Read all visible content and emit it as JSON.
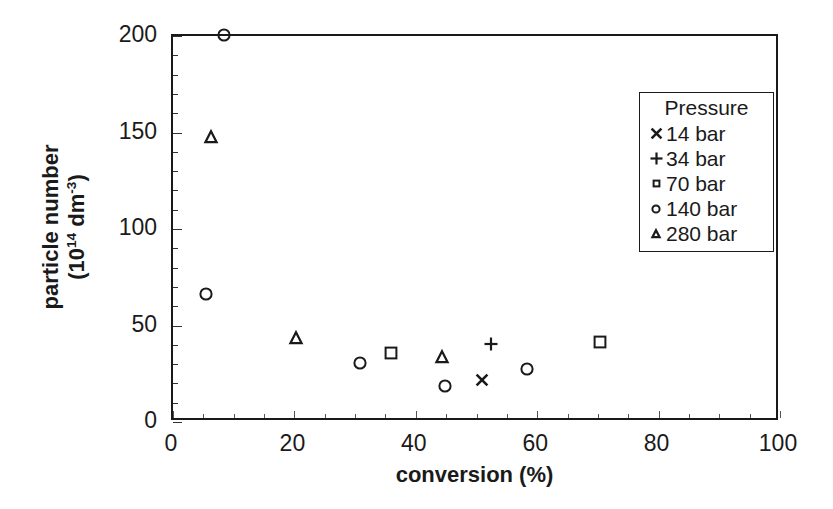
{
  "chart_data": {
    "type": "scatter",
    "title": "",
    "xlabel": "conversion (%)",
    "ylabel_line1": "particle number",
    "ylabel_line2_pre": "(10",
    "ylabel_line2_sup1": "14",
    "ylabel_line2_mid": " dm",
    "ylabel_line2_sup2": "-3",
    "ylabel_line2_post": ")",
    "xlim": [
      0,
      100
    ],
    "ylim": [
      0,
      200
    ],
    "xticks": [
      0,
      20,
      40,
      60,
      80,
      100
    ],
    "yticks": [
      0,
      50,
      100,
      150,
      200
    ],
    "x_minor_step": 5,
    "y_minor_step": 10,
    "grid": false,
    "legend_position": "upper-right",
    "legend_title": "Pressure",
    "series": [
      {
        "name": "14 bar",
        "label": "14 bar",
        "marker": "cross-x",
        "points": [
          [
            51.0,
            21
          ]
        ]
      },
      {
        "name": "34 bar",
        "label": "34 bar",
        "marker": "plus",
        "points": [
          [
            52.5,
            40
          ]
        ]
      },
      {
        "name": "70 bar",
        "label": "70 bar",
        "marker": "square",
        "points": [
          [
            36.0,
            35
          ],
          [
            70.5,
            41
          ]
        ]
      },
      {
        "name": "140 bar",
        "label": "140 bar",
        "marker": "circle",
        "points": [
          [
            8.6,
            200
          ],
          [
            5.6,
            66
          ],
          [
            31.0,
            30
          ],
          [
            45.0,
            18
          ],
          [
            58.5,
            27
          ]
        ]
      },
      {
        "name": "280 bar",
        "label": "280 bar",
        "marker": "triangle",
        "points": [
          [
            6.5,
            147
          ],
          [
            20.5,
            43
          ],
          [
            44.5,
            33
          ]
        ]
      }
    ],
    "colors": {
      "axis": "#1a1a1a",
      "marker": "#1a1a1a",
      "background": "#ffffff"
    }
  }
}
